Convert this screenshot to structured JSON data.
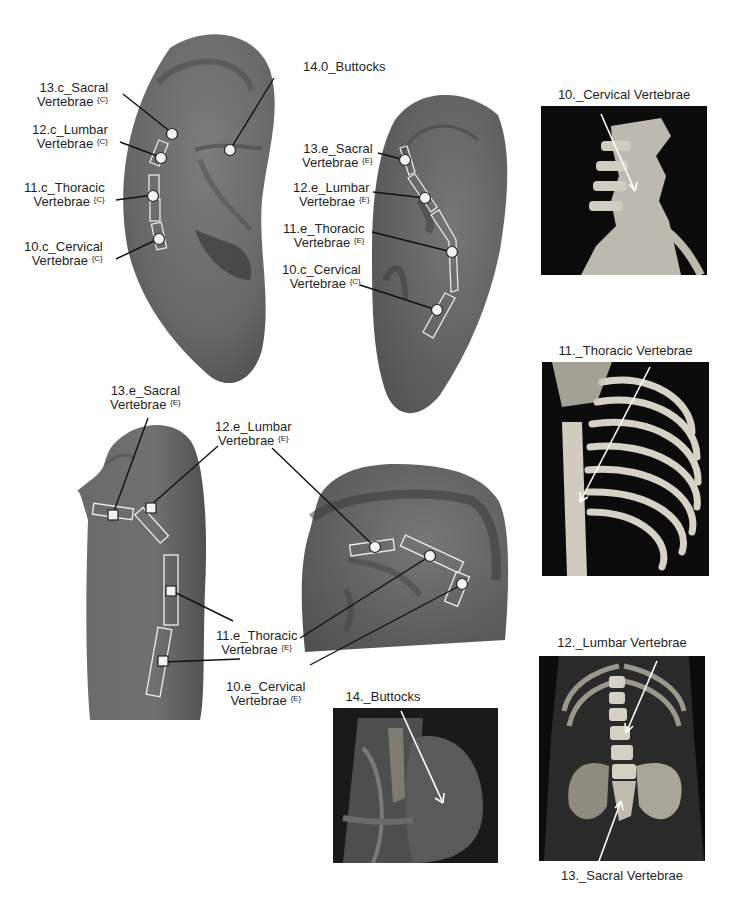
{
  "figure": {
    "ear_views": [
      {
        "id": "ear-top-left",
        "points": [
          {
            "label_line1": "13.c_Sacral",
            "label_line2": "Vertebrae",
            "superscript": "{C}"
          },
          {
            "label_line1": "12.c_Lumbar",
            "label_line2": "Vertebrae",
            "superscript": "{C}"
          },
          {
            "label_line1": "11.c_Thoracic",
            "label_line2": "Vertebrae",
            "superscript": "{C}"
          },
          {
            "label_line1": "10.c_Cervical",
            "label_line2": "Vertebrae",
            "superscript": "{C}"
          },
          {
            "label_line1": "14.0_Buttocks"
          }
        ]
      },
      {
        "id": "ear-top-right",
        "points": [
          {
            "label_line1": "13.e_Sacral",
            "label_line2": "Vertebrae",
            "superscript": "{E}"
          },
          {
            "label_line1": "12.e_Lumbar",
            "label_line2": "Vertebrae",
            "superscript": "{E}"
          },
          {
            "label_line1": "11.e_Thoracic",
            "label_line2": "Vertebrae",
            "superscript": "{E}"
          },
          {
            "label_line1": "10.c_Cervical",
            "label_line2": "Vertebrae",
            "superscript": "{C}"
          }
        ]
      },
      {
        "id": "ear-bottom-left-and-center",
        "points": [
          {
            "label_line1": "13.e_Sacral",
            "label_line2": "Vertebrae",
            "superscript": "{E}"
          },
          {
            "label_line1": "12.e_Lumbar",
            "label_line2": "Vertebrae",
            "superscript": "{E}"
          },
          {
            "label_line1": "11.e_Thoracic",
            "label_line2": "Vertebrae",
            "superscript": "{E}"
          },
          {
            "label_line1": "10.e_Cervical",
            "label_line2": "Vertebrae",
            "superscript": "{E}"
          }
        ]
      }
    ],
    "anatomy_photos": [
      {
        "caption": "10._Cervical Vertebrae"
      },
      {
        "caption": "11._Thoracic Vertebrae"
      },
      {
        "caption": "12._Lumbar Vertebrae",
        "caption_bottom": "13._Sacral Vertebrae"
      },
      {
        "caption": "14._Buttocks"
      }
    ],
    "colors": {
      "ear_fill": "#6e6e6e",
      "ear_dark": "#4a4a4a",
      "marker_fill": "#f2f2f2",
      "leader_line": "#111111",
      "photo_bg": "#0b0b0b",
      "bone": "#d9d6cc"
    }
  }
}
